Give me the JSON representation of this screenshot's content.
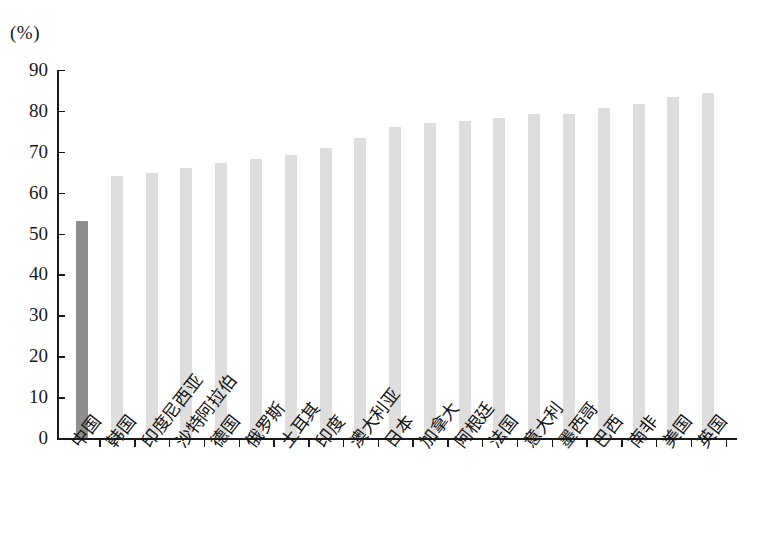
{
  "chart_data": {
    "type": "bar",
    "title": "",
    "subtitle": "",
    "xlabel": "",
    "ylabel": "(%)",
    "ylim": [
      0,
      90
    ],
    "ytick_step": 10,
    "yticks": [
      0,
      10,
      20,
      30,
      40,
      50,
      60,
      70,
      80,
      90
    ],
    "grid": false,
    "legend": false,
    "categories": [
      "中国",
      "韩国",
      "印度尼西亚",
      "沙特阿拉伯",
      "德国",
      "俄罗斯",
      "土耳其",
      "印度",
      "澳大利亚",
      "日本",
      "加拿大",
      "阿根廷",
      "法国",
      "意大利",
      "墨西哥",
      "巴西",
      "南非",
      "美国",
      "英国"
    ],
    "values": [
      53,
      64,
      64.7,
      66,
      67.2,
      68.2,
      69.3,
      71,
      73.3,
      76.1,
      77,
      77.5,
      78.2,
      79.2,
      79.3,
      80.8,
      81.8,
      83.5,
      84.3
    ],
    "highlight_index": 0,
    "colors": {
      "bar": "#dedede",
      "bar_highlight": "#8d8d8d",
      "axis": "#1a1a1a",
      "text": "#1a1a1a",
      "background": "#ffffff"
    }
  }
}
